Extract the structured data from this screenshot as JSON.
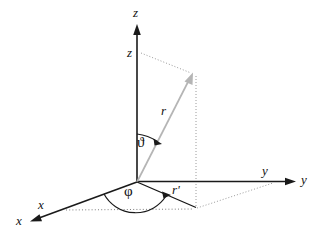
{
  "figure": {
    "type": "3d-coordinate-diagram",
    "background_color": "#ffffff"
  },
  "colors": {
    "axis": "#1a1a1a",
    "vector": "#b5b5b5",
    "projection": "#151515",
    "dotted": "#9a9a9a",
    "label": "#111111"
  },
  "labels": {
    "z_axis": "z",
    "z_height": "z",
    "y_axis_inner": "y",
    "y_axis_outer": "y",
    "x_axis_inner": "x",
    "x_axis_outer": "x",
    "r_vector": "r",
    "r_magnitude": "r",
    "r_prime": "r'",
    "theta": "ϑ",
    "phi": "φ"
  },
  "geometry": {
    "origin": {
      "x": 137,
      "y": 182
    },
    "z_axis_tip": {
      "x": 137,
      "y": 25
    },
    "y_axis_tip": {
      "x": 296,
      "y": 181
    },
    "x_axis_tip": {
      "x": 30,
      "y": 220
    },
    "point_r": {
      "x": 193,
      "y": 74
    },
    "projection_xy": {
      "x": 196,
      "y": 208
    },
    "z_dotted_start": {
      "x": 140,
      "y": 53
    },
    "y_dotted_end": {
      "x": 273,
      "y": 183
    },
    "x_dotted_start": {
      "x": 66,
      "y": 210
    }
  },
  "annotations": {
    "theta_description": "polar angle from z-axis to r vector",
    "phi_description": "azimuthal angle from x-axis to r' in xy-plane"
  }
}
